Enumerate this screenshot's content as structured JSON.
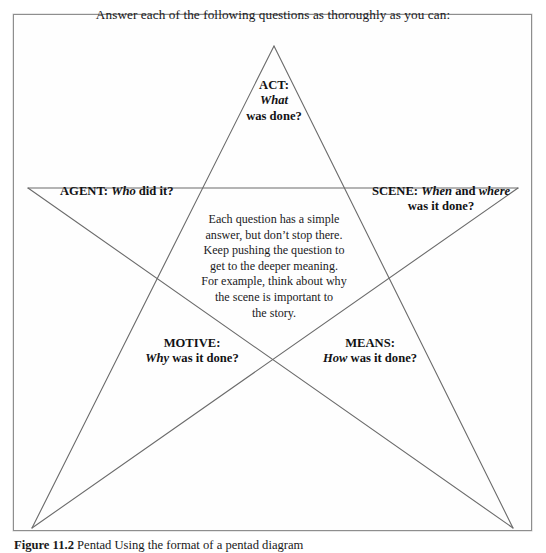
{
  "figure": {
    "heading": "Answer each of the following questions as thoroughly as you can:",
    "caption_number": "Figure 11.2",
    "caption_text": "Pentad Using the format of a pentad diagram",
    "line_color": "#6b6b6b",
    "frame_color": "#8e8e8e",
    "background_color": "#fefefe",
    "text_color": "#1a1a1a"
  },
  "points": {
    "act": {
      "title": "ACT:",
      "line2": "What",
      "line3": "was done?"
    },
    "agent": {
      "title": "AGENT:",
      "emphasis": "Who",
      "rest": "did it?"
    },
    "scene": {
      "title": "SCENE:",
      "emphasis1": "When",
      "conjunction": "and",
      "emphasis2": "where",
      "line2": "was it done?"
    },
    "motive": {
      "title": "MOTIVE:",
      "emphasis": "Why",
      "rest": "was it done?"
    },
    "means": {
      "title": "MEANS:",
      "emphasis": "How",
      "rest": "was it done?"
    }
  },
  "center_note": {
    "line1": "Each question has a simple",
    "line2": "answer, but don’t stop there.",
    "line3": "Keep pushing the question to",
    "line4": "get to the deeper meaning.",
    "line5_a": "For example, think about",
    "line5_em": "why",
    "line6": "the scene is important to",
    "line7": "the story."
  },
  "geometry": {
    "apex_top": [
      274,
      46
    ],
    "point_left": [
      28,
      188
    ],
    "point_right": [
      518,
      188
    ],
    "point_bottom_left": [
      32,
      528
    ],
    "point_bottom_right": [
      513,
      528
    ]
  }
}
